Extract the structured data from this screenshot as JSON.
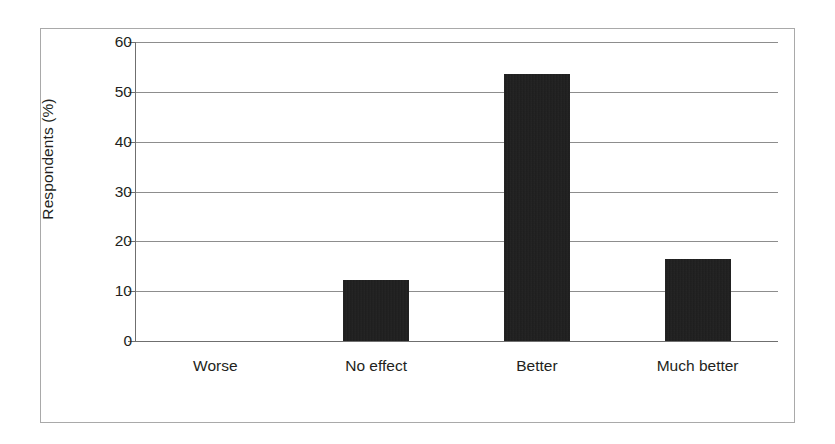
{
  "chart_data": {
    "type": "bar",
    "title": "",
    "xlabel": "",
    "ylabel": "Respondents (%)",
    "categories": [
      "Worse",
      "No effect",
      "Better",
      "Much better"
    ],
    "values": [
      0,
      12.3,
      53.5,
      16.4
    ],
    "ylim": [
      0,
      60
    ],
    "yticks": [
      0,
      10,
      20,
      30,
      40,
      50,
      60
    ],
    "ytick_labels": [
      "0",
      "10",
      "20",
      "30",
      "40",
      "50",
      "60"
    ],
    "grid": "horizontal",
    "legend": "none",
    "bar_color": "#1a1a1a",
    "gridline_color": "#8d8d8d",
    "axis_color": "#6f6f6f",
    "frame_color": "#a9a9a9",
    "background_color": "#ffffff"
  }
}
